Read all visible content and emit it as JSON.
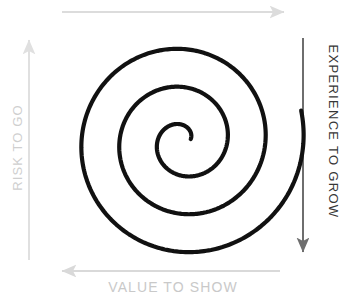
{
  "diagram": {
    "background_color": "#ffffff",
    "spiral": {
      "name": "spiral-path",
      "stroke_color": "#111111",
      "stroke_width": 4.2,
      "turns": 3,
      "center_x": 183,
      "center_y": 141,
      "start_radius": 8,
      "end_radius": 122,
      "direction": "counter-clockwise-outward"
    },
    "axes": [
      {
        "id": "top",
        "name": "top-arrow",
        "label": "",
        "color": "#dcdcdc",
        "direction": "right",
        "x1": 62,
        "y1": 12,
        "x2": 284,
        "y2": 12
      },
      {
        "id": "left",
        "name": "left-arrow",
        "label": "RISK TO GO",
        "color": "#e0e0e0",
        "text_color": "#cfcfcf",
        "direction": "up",
        "x1": 29,
        "y1": 260,
        "x2": 29,
        "y2": 40
      },
      {
        "id": "right",
        "name": "right-arrow",
        "label": "EXPERIENCE TO GROW",
        "color": "#6e6e6e",
        "text_color": "#363636",
        "direction": "down",
        "x1": 303,
        "y1": 38,
        "x2": 303,
        "y2": 252
      },
      {
        "id": "bottom",
        "name": "bottom-arrow",
        "label": "VALUE TO SHOW",
        "color": "#d9d9d9",
        "text_color": "#c9c9c9",
        "direction": "left",
        "x1": 280,
        "y1": 271,
        "x2": 62,
        "y2": 271
      }
    ],
    "labels": {
      "risk_to_go": "RISK TO GO",
      "value_to_show": "VALUE TO SHOW",
      "experience_to_grow": "EXPERIENCE TO GROW"
    }
  }
}
